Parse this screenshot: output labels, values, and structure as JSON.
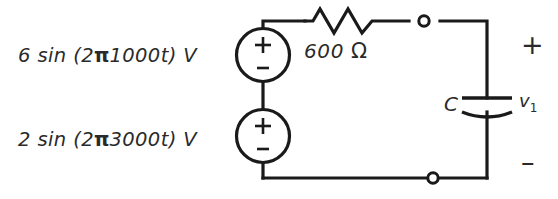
{
  "figure": {
    "kind": "circuit-schematic",
    "ink_color": "#1a1a1a",
    "background_color": "#ffffff"
  },
  "sources": [
    {
      "id": "source-1",
      "label": "6 sin (2π1000t) V",
      "amplitude": "6",
      "function": "sin",
      "frequency_expr": "2π1000t",
      "unit": "V",
      "plus_sign": "+",
      "minus_sign": "-"
    },
    {
      "id": "source-2",
      "label": "2 sin (2π3000t) V",
      "amplitude": "2",
      "function": "sin",
      "frequency_expr": "2π3000t",
      "unit": "V",
      "plus_sign": "+",
      "minus_sign": "-"
    }
  ],
  "resistor": {
    "value": "600",
    "unit": "Ω",
    "label": "600 Ω"
  },
  "capacitor": {
    "symbol": "C",
    "voltage_label": "v",
    "voltage_subscript": "1",
    "voltage_label_full": "v₁"
  },
  "output_port": {
    "plus_sign": "+",
    "minus_sign": "–"
  },
  "terminals": [
    {
      "id": "terminal-top",
      "type": "open-node"
    },
    {
      "id": "terminal-bottom",
      "type": "open-node"
    }
  ]
}
